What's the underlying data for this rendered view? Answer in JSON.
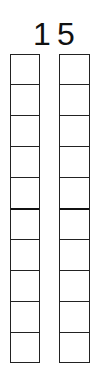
{
  "number": {
    "tens_digit": "1",
    "ones_digit": "5"
  },
  "columns": [
    {
      "name": "tens-column",
      "cells": 10,
      "divider_after": 5
    },
    {
      "name": "ones-column",
      "cells": 10,
      "divider_after": 5
    }
  ],
  "colors": {
    "line": "#222222",
    "text": "#111111",
    "background": "#ffffff"
  }
}
